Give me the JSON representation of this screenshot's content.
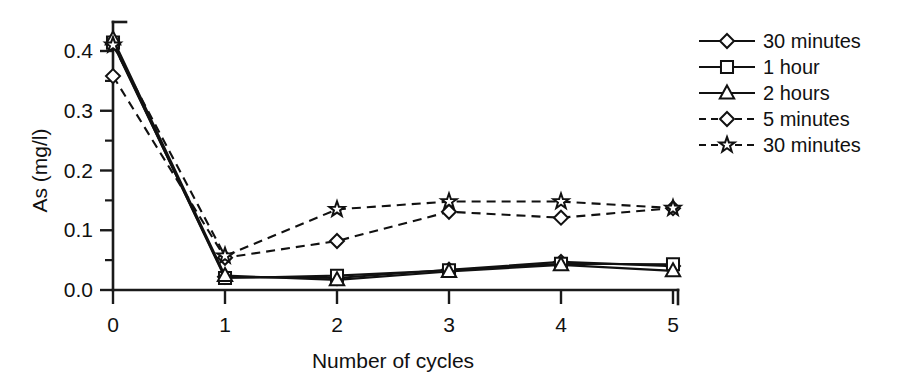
{
  "chart_data": {
    "type": "line",
    "title": "",
    "xlabel": "Number of cycles",
    "ylabel": "As (mg/l)",
    "xlim": [
      0,
      5
    ],
    "ylim": [
      0.0,
      0.4
    ],
    "grid": false,
    "legend_position": "right",
    "x": [
      0,
      1,
      2,
      3,
      4,
      5
    ],
    "xticks": [
      "0",
      "1",
      "2",
      "3",
      "4",
      "5"
    ],
    "yticks": [
      "0.0",
      "0.1",
      "0.2",
      "0.3",
      "0.4"
    ],
    "ytick_values": [
      0.0,
      0.1,
      0.2,
      0.3,
      0.4
    ],
    "yminor_values": [
      0.05,
      0.15,
      0.25,
      0.35
    ],
    "series": [
      {
        "name": "30 minutes",
        "marker": "diamond",
        "line": "solid",
        "values": [
          0.412,
          0.022,
          0.02,
          0.034,
          0.047,
          0.04
        ]
      },
      {
        "name": "1 hour",
        "marker": "square",
        "line": "solid",
        "values": [
          0.414,
          0.02,
          0.024,
          0.033,
          0.044,
          0.043
        ]
      },
      {
        "name": "2 hours",
        "marker": "triangle",
        "line": "solid",
        "values": [
          0.42,
          0.024,
          0.017,
          0.031,
          0.042,
          0.032
        ]
      },
      {
        "name": "5 minutes",
        "marker": "diamond",
        "line": "dashed",
        "values": [
          0.358,
          0.054,
          0.082,
          0.131,
          0.121,
          0.137
        ]
      },
      {
        "name": "30 minutes",
        "marker": "star",
        "line": "dashed",
        "values": [
          0.41,
          0.057,
          0.135,
          0.148,
          0.148,
          0.137
        ]
      }
    ]
  },
  "legend": {
    "entries": [
      {
        "label": "30 minutes",
        "marker": "diamond",
        "line": "solid"
      },
      {
        "label": "1 hour",
        "marker": "square",
        "line": "solid"
      },
      {
        "label": "2 hours",
        "marker": "triangle",
        "line": "solid"
      },
      {
        "label": "5 minutes",
        "marker": "diamond",
        "line": "dashed"
      },
      {
        "label": "30 minutes",
        "marker": "star",
        "line": "dashed"
      }
    ]
  }
}
